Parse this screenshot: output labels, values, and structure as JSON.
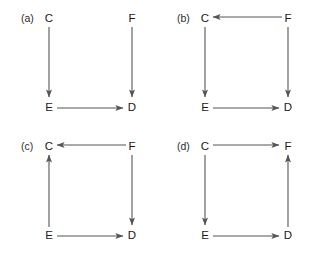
{
  "figure": {
    "type": "diagram",
    "background_color": "#ffffff",
    "edge_color": "#555555",
    "text_color": "#1a1a1a",
    "node_positions": {
      "C": "top-left",
      "F": "top-right",
      "E": "bottom-left",
      "D": "bottom-right"
    }
  },
  "panels": [
    {
      "id": "a",
      "label": "(a)",
      "nodes": [
        {
          "id": "C",
          "label": "C",
          "position": "top-left"
        },
        {
          "id": "F",
          "label": "F",
          "position": "top-right"
        },
        {
          "id": "E",
          "label": "E",
          "position": "bottom-left"
        },
        {
          "id": "D",
          "label": "D",
          "position": "bottom-right"
        }
      ],
      "edges": [
        {
          "from": "C",
          "to": "E",
          "direction": "down"
        },
        {
          "from": "F",
          "to": "D",
          "direction": "down"
        },
        {
          "from": "E",
          "to": "D",
          "direction": "right"
        }
      ]
    },
    {
      "id": "b",
      "label": "(b)",
      "nodes": [
        {
          "id": "C",
          "label": "C",
          "position": "top-left"
        },
        {
          "id": "F",
          "label": "F",
          "position": "top-right"
        },
        {
          "id": "E",
          "label": "E",
          "position": "bottom-left"
        },
        {
          "id": "D",
          "label": "D",
          "position": "bottom-right"
        }
      ],
      "edges": [
        {
          "from": "F",
          "to": "C",
          "direction": "left"
        },
        {
          "from": "C",
          "to": "E",
          "direction": "down"
        },
        {
          "from": "F",
          "to": "D",
          "direction": "down"
        },
        {
          "from": "E",
          "to": "D",
          "direction": "right"
        }
      ]
    },
    {
      "id": "c",
      "label": "(c)",
      "nodes": [
        {
          "id": "C",
          "label": "C",
          "position": "top-left"
        },
        {
          "id": "F",
          "label": "F",
          "position": "top-right"
        },
        {
          "id": "E",
          "label": "E",
          "position": "bottom-left"
        },
        {
          "id": "D",
          "label": "D",
          "position": "bottom-right"
        }
      ],
      "edges": [
        {
          "from": "F",
          "to": "C",
          "direction": "left"
        },
        {
          "from": "E",
          "to": "C",
          "direction": "up"
        },
        {
          "from": "F",
          "to": "D",
          "direction": "down"
        },
        {
          "from": "E",
          "to": "D",
          "direction": "right"
        }
      ]
    },
    {
      "id": "d",
      "label": "(d)",
      "nodes": [
        {
          "id": "C",
          "label": "C",
          "position": "top-left"
        },
        {
          "id": "F",
          "label": "F",
          "position": "top-right"
        },
        {
          "id": "E",
          "label": "E",
          "position": "bottom-left"
        },
        {
          "id": "D",
          "label": "D",
          "position": "bottom-right"
        }
      ],
      "edges": [
        {
          "from": "C",
          "to": "F",
          "direction": "right"
        },
        {
          "from": "C",
          "to": "E",
          "direction": "down"
        },
        {
          "from": "D",
          "to": "F",
          "direction": "up"
        },
        {
          "from": "E",
          "to": "D",
          "direction": "right"
        }
      ]
    }
  ]
}
